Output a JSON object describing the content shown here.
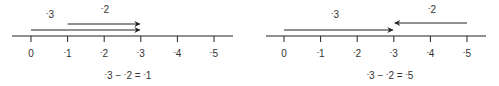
{
  "panels": [
    {
      "name": "subtract-negative-2-from-negative-3",
      "ticks": [
        "0",
        "-1",
        "-2",
        "-3",
        "-4",
        "-5"
      ],
      "arrows": [
        {
          "label": "-3",
          "from": 0,
          "to": -3
        },
        {
          "label": "-2",
          "from": -1,
          "to": -3
        }
      ],
      "equation": {
        "a": "-3",
        "op": "−",
        "b": "-2",
        "eq": "=",
        "result": "-1"
      }
    },
    {
      "name": "subtract-negative-2-from-negative-3-wrong",
      "ticks": [
        "0",
        "-1",
        "-2",
        "-3",
        "-4",
        "-5"
      ],
      "arrows": [
        {
          "label": "-3",
          "from": 0,
          "to": -3
        },
        {
          "label": "-2",
          "from": -5,
          "to": -3
        }
      ],
      "equation": {
        "a": "-3",
        "op": "−",
        "b": "-2",
        "eq": "=",
        "result": "-5"
      }
    }
  ],
  "colors": {
    "line": "#222222",
    "text": "#333333"
  }
}
